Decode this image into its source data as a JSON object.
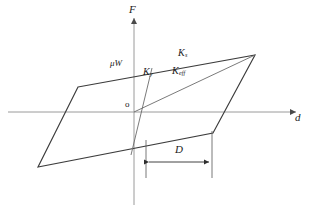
{
  "figure": {
    "background_color": "#ffffff",
    "axis_color": "#9a9a9a",
    "loop_color": "#3c3c3c",
    "inner_line_color": "#6b6b6b",
    "text_color": "#1a1a1a"
  },
  "axes": {
    "vertical_label": "F",
    "horizontal_label": "d",
    "origin_label": "o",
    "origin": {
      "x": 134,
      "y": 112
    },
    "vertical": {
      "x": 134,
      "y_top": 14,
      "y_bottom": 205
    },
    "horizontal": {
      "y": 112,
      "x_left": 8,
      "x_right": 300
    }
  },
  "labels": {
    "friction_force": {
      "base": "μW",
      "sub": ""
    },
    "post_yield_stiffness": {
      "base": "K",
      "sub": "s"
    },
    "elastic_stiffness": {
      "base": "K",
      "sub": "y"
    },
    "effective_stiffness": {
      "base": "K",
      "sub": "eff"
    },
    "design_displacement": {
      "base": "D",
      "sub": ""
    }
  },
  "loop": {
    "type": "parallelogram",
    "vertices": [
      {
        "x": 78,
        "y": 87
      },
      {
        "x": 255,
        "y": 55
      },
      {
        "x": 213,
        "y": 133
      },
      {
        "x": 38,
        "y": 167
      }
    ]
  },
  "inner_lines": {
    "yield_line": {
      "x1": 152,
      "y1": 68,
      "x2": 131,
      "y2": 155
    },
    "effective_line": {
      "x1": 134,
      "y1": 112,
      "x2": 255,
      "y2": 55
    }
  },
  "dimension": {
    "label": "D",
    "line_y": 162,
    "x_start": 146,
    "x_end": 212,
    "extension_left": {
      "x": 146,
      "y_top": 140,
      "y_bottom": 178
    },
    "extension_right": {
      "x": 212,
      "y_top": 131,
      "y_bottom": 178
    }
  }
}
